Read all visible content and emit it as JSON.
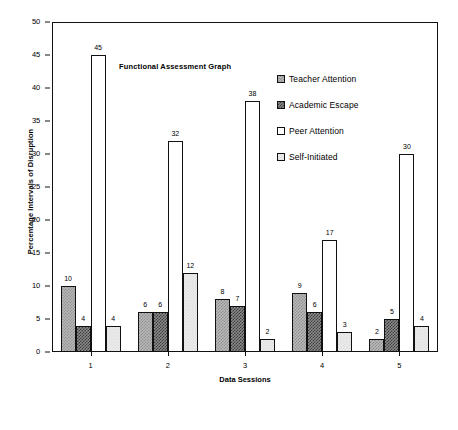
{
  "chart_data": {
    "type": "bar",
    "title": "Functional Assessment Graph",
    "xlabel": "Data Sessions",
    "ylabel": "Percentage Intervals of Disruption",
    "categories": [
      "1",
      "2",
      "3",
      "4",
      "5"
    ],
    "ylim": [
      0,
      50
    ],
    "ytick_step": 5,
    "yticks": [
      "0",
      "5",
      "10",
      "15",
      "20",
      "25",
      "30",
      "35",
      "40",
      "45",
      "50"
    ],
    "grid": false,
    "legend_position": "inside-top-right",
    "value_labels": true,
    "series": [
      {
        "name": "Teacher Attention",
        "swatch": "medium-gray-checker",
        "color": "#b9b9b9",
        "values": [
          10,
          6,
          8,
          9,
          2
        ]
      },
      {
        "name": "Academic Escape",
        "swatch": "dark-gray-checker",
        "color": "#3d3d3d",
        "values": [
          4,
          6,
          7,
          6,
          5
        ]
      },
      {
        "name": "Peer Attention",
        "swatch": "white",
        "color": "#ffffff",
        "values": [
          45,
          32,
          38,
          17,
          30
        ]
      },
      {
        "name": "Self-Initiated",
        "swatch": "light-gray-checker",
        "color": "#ededed",
        "values": [
          4,
          12,
          2,
          3,
          4
        ]
      }
    ]
  }
}
